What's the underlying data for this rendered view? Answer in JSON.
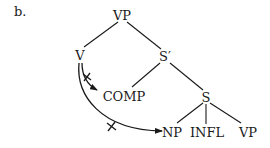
{
  "figure": {
    "item_label": "b."
  },
  "tree": {
    "nodes": {
      "vp_root": "VP",
      "v": "V",
      "s_bar": "S′",
      "comp": "COMP",
      "s": "S",
      "np": "NP",
      "infl": "INFL",
      "vp_leaf": "VP"
    },
    "edges": [
      [
        "VP",
        "V"
      ],
      [
        "VP",
        "S′"
      ],
      [
        "S′",
        "COMP"
      ],
      [
        "S′",
        "S"
      ],
      [
        "S",
        "NP"
      ],
      [
        "S",
        "INFL"
      ],
      [
        "S",
        "VP"
      ]
    ],
    "movement_arrows": [
      {
        "from": "V",
        "to": "COMP",
        "blocked": true
      },
      {
        "from": "V",
        "to": "NP",
        "blocked": true
      }
    ]
  }
}
